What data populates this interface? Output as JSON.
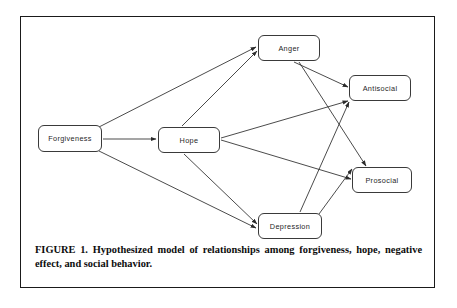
{
  "figure": {
    "caption_line1": "FIGURE 1. Hypothesized model of relationships among forgiveness, hope,",
    "caption_line2": "negative effect, and social behavior.",
    "caption_full": "FIGURE 1. Hypothesized model of relationships among forgiveness, hope, negative effect, and social behavior.",
    "frame_color": "#1a1a1a",
    "background_color": "#ffffff"
  },
  "diagram": {
    "type": "path-model",
    "node_border_color": "#3a3a3a",
    "edge_color": "#2b2b2b",
    "nodes": [
      {
        "id": "forgiveness",
        "label": "Forgiveness",
        "x": 38,
        "y": 125,
        "width": 64,
        "height": 27
      },
      {
        "id": "hope",
        "label": "Hope",
        "x": 158,
        "y": 127,
        "width": 62,
        "height": 26
      },
      {
        "id": "anger",
        "label": "Anger",
        "x": 258,
        "y": 35,
        "width": 62,
        "height": 26
      },
      {
        "id": "antisocial",
        "label": "Antisocial",
        "x": 349,
        "y": 75,
        "width": 62,
        "height": 26
      },
      {
        "id": "prosocial",
        "label": "Prosocial",
        "x": 352,
        "y": 167,
        "width": 60,
        "height": 26
      },
      {
        "id": "depression",
        "label": "Depression",
        "x": 258,
        "y": 213,
        "width": 64,
        "height": 26
      }
    ],
    "edges": [
      {
        "from": "forgiveness",
        "to": "anger",
        "label": ""
      },
      {
        "from": "forgiveness",
        "to": "hope",
        "label": ""
      },
      {
        "from": "forgiveness",
        "to": "depression",
        "label": ""
      },
      {
        "from": "hope",
        "to": "anger",
        "label": ""
      },
      {
        "from": "hope",
        "to": "antisocial",
        "label": ""
      },
      {
        "from": "hope",
        "to": "prosocial",
        "label": ""
      },
      {
        "from": "hope",
        "to": "depression",
        "label": ""
      },
      {
        "from": "anger",
        "to": "antisocial",
        "label": ""
      },
      {
        "from": "anger",
        "to": "prosocial",
        "label": ""
      },
      {
        "from": "depression",
        "to": "antisocial",
        "label": ""
      },
      {
        "from": "depression",
        "to": "prosocial",
        "label": ""
      }
    ]
  }
}
